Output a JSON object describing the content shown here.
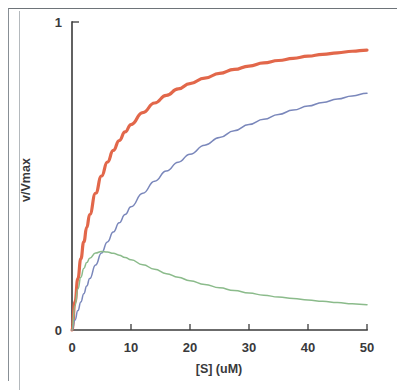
{
  "figure": {
    "kind": "scanned-figure",
    "background_color": "#ffffff",
    "frame_color": "#888f95"
  },
  "axes": {
    "y_title": "v/Vmax",
    "x_title": "[S] (uM)",
    "y_tick_labels": [
      "0",
      "1"
    ],
    "x_tick_labels": [
      "0",
      "10",
      "20",
      "30",
      "40",
      "50"
    ],
    "axis_color": "#3b3b3b"
  },
  "chart_data": {
    "type": "line",
    "title": "",
    "subtitle": "",
    "xlabel": "[S] (uM)",
    "ylabel": "v/Vmax",
    "xlim": [
      0,
      50
    ],
    "ylim": [
      0,
      1
    ],
    "xticks": [
      0,
      10,
      20,
      30,
      40,
      50
    ],
    "yticks": [
      0,
      1
    ],
    "xtick_labels": [
      "0",
      "10",
      "20",
      "30",
      "40",
      "50"
    ],
    "ytick_labels": [
      "0",
      "1"
    ],
    "grid": false,
    "legend": null,
    "legend_position": "none",
    "annotations": [],
    "x": [
      0,
      0.5,
      1,
      1.5,
      2,
      2.5,
      3,
      4,
      5,
      6,
      7,
      8,
      9,
      10,
      12,
      14,
      16,
      18,
      20,
      22.5,
      25,
      27.5,
      30,
      32.5,
      35,
      37.5,
      40,
      42.5,
      45,
      47.5,
      50
    ],
    "series": [
      {
        "name": "uninhibited",
        "color": "#e2674a",
        "line_width": 3.2,
        "model": "Michaelis-Menten, Km = 5 uM",
        "values": [
          0.0,
          0.091,
          0.167,
          0.231,
          0.286,
          0.333,
          0.375,
          0.444,
          0.5,
          0.545,
          0.583,
          0.615,
          0.643,
          0.667,
          0.706,
          0.737,
          0.762,
          0.783,
          0.8,
          0.818,
          0.833,
          0.846,
          0.857,
          0.867,
          0.875,
          0.882,
          0.889,
          0.895,
          0.9,
          0.905,
          0.909
        ]
      },
      {
        "name": "competitive-inhibited",
        "color": "#7a87bb",
        "line_width": 1.5,
        "model": "Michaelis-Menten, Km(app) = 15 uM",
        "values": [
          0.0,
          0.032,
          0.063,
          0.091,
          0.118,
          0.143,
          0.167,
          0.211,
          0.25,
          0.286,
          0.318,
          0.348,
          0.375,
          0.4,
          0.444,
          0.483,
          0.516,
          0.545,
          0.571,
          0.6,
          0.625,
          0.647,
          0.667,
          0.684,
          0.7,
          0.714,
          0.727,
          0.739,
          0.75,
          0.76,
          0.769
        ]
      },
      {
        "name": "substrate-inhibited",
        "color": "#8bbb8b",
        "line_width": 1.5,
        "model": "Substrate inhibition, Km = 5 uM, Ksi = 1.2 uM",
        "values": [
          0.0,
          0.079,
          0.133,
          0.171,
          0.2,
          0.219,
          0.233,
          0.25,
          0.255,
          0.253,
          0.249,
          0.243,
          0.235,
          0.228,
          0.212,
          0.197,
          0.183,
          0.171,
          0.16,
          0.148,
          0.137,
          0.128,
          0.12,
          0.113,
          0.107,
          0.102,
          0.097,
          0.093,
          0.089,
          0.085,
          0.082
        ]
      }
    ]
  }
}
